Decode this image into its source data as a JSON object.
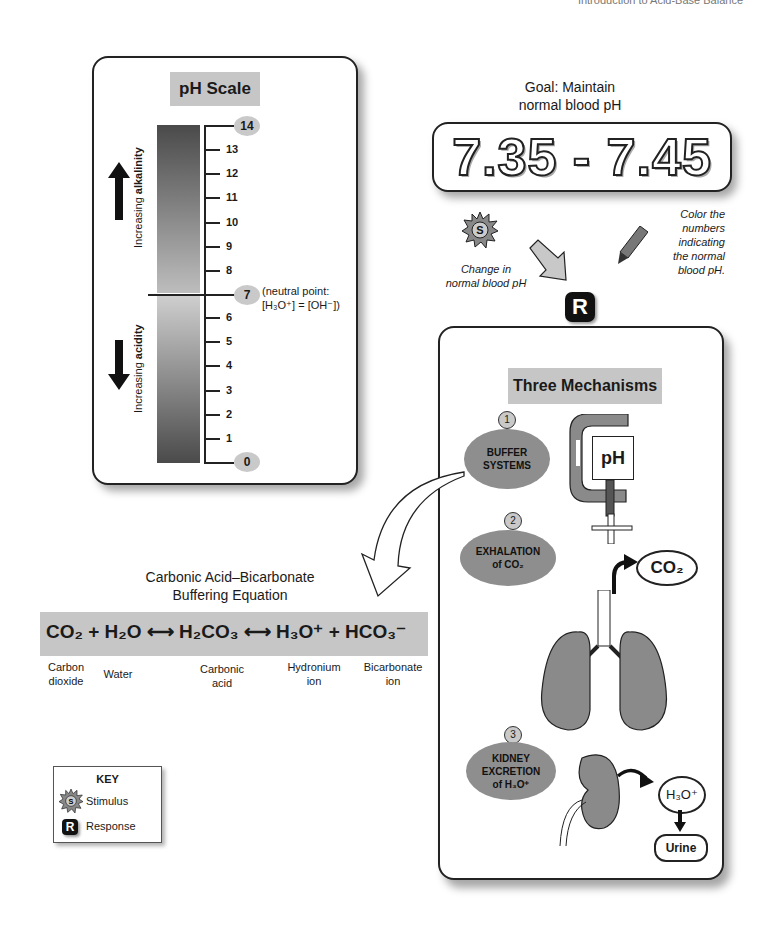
{
  "page_header": "Introduction to Acid-Base Balance",
  "ph_scale": {
    "title": "pH Scale",
    "ticks": [
      "14",
      "13",
      "12",
      "11",
      "10",
      "9",
      "8",
      "7",
      "6",
      "5",
      "4",
      "3",
      "2",
      "1",
      "0"
    ],
    "neutral_note_line1": "(neutral point:",
    "neutral_note_line2": "[H₃O⁺] = [OH⁻])",
    "alkalinity_prefix": "Increasing ",
    "alkalinity_bold": "alkalinity",
    "acidity_prefix": "Increasing ",
    "acidity_bold": "acidity"
  },
  "goal": {
    "title_line1": "Goal: Maintain",
    "title_line2": "normal blood pH",
    "range": "7.35 - 7.45"
  },
  "stimulus": {
    "badge": "S",
    "note_line1": "Change in",
    "note_line2": "normal blood pH"
  },
  "color_note": [
    "Color the",
    "numbers",
    "indicating",
    "the normal",
    "blood pH."
  ],
  "response_badge": "R",
  "mechanisms": {
    "title": "Three Mechanisms",
    "items": [
      {
        "number": "1",
        "line1": "BUFFER",
        "line2": "SYSTEMS"
      },
      {
        "number": "2",
        "line1": "EXHALATION",
        "line2": "of CO₂"
      },
      {
        "number": "3",
        "line1": "KIDNEY",
        "line2": "EXCRETION",
        "line3": "of H₃O⁺"
      }
    ],
    "clamp_label": "pH",
    "co2_bubble": "CO₂",
    "h3o_bubble": "H₃O⁺",
    "urine_bubble": "Urine"
  },
  "equation": {
    "title_line1": "Carbonic Acid–Bicarbonate",
    "title_line2": "Buffering Equation",
    "formula": "CO₂ + H₂O ⟷ H₂CO₃ ⟷ H₃O⁺ + HCO₃⁻",
    "labels": [
      {
        "line1": "Carbon",
        "line2": "dioxide"
      },
      {
        "line1": "Water",
        "line2": ""
      },
      {
        "line1": "Carbonic",
        "line2": "acid"
      },
      {
        "line1": "Hydronium",
        "line2": "ion"
      },
      {
        "line1": "Bicarbonate",
        "line2": "ion"
      }
    ]
  },
  "key": {
    "title": "KEY",
    "stimulus_badge": "S",
    "stimulus_label": "Stimulus",
    "response_badge": "R",
    "response_label": "Response"
  },
  "colors": {
    "panel_title_bg": "#c6c6c6",
    "oval_fill": "#8e8e8e",
    "organ_fill": "#8a8a8a",
    "outline": "#222222"
  }
}
